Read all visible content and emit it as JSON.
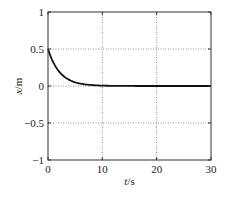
{
  "chart_data": {
    "type": "line",
    "title": "",
    "xlabel": "t/s",
    "xlabel_var": "t",
    "xlabel_unit": "/s",
    "ylabel": "x/m",
    "ylabel_var": "x",
    "ylabel_unit": "/m",
    "xlim": [
      0,
      30
    ],
    "ylim": [
      -1,
      1
    ],
    "xticks": [
      0,
      10,
      20,
      30
    ],
    "xtick_labels": [
      "0",
      "10",
      "20",
      "30"
    ],
    "yticks": [
      -1,
      -0.5,
      0,
      0.5,
      1
    ],
    "ytick_labels": [
      "−1",
      "−0.5",
      "0",
      "0.5",
      "1"
    ],
    "grid": true,
    "grid_style": "dotted",
    "legend": null,
    "series": [
      {
        "name": "x(t)",
        "color": "#111111",
        "x": [
          0,
          1,
          2,
          3,
          4,
          5,
          6,
          7,
          8,
          9,
          10,
          12,
          15,
          20,
          25,
          30
        ],
        "values": [
          0.5,
          0.32,
          0.2,
          0.13,
          0.08,
          0.05,
          0.035,
          0.02,
          0.013,
          0.008,
          0.005,
          0.002,
          0.0,
          0.0,
          0.0,
          0.0
        ]
      }
    ]
  },
  "plot": {
    "left": 48,
    "top": 12,
    "right": 211,
    "bottom": 160
  }
}
